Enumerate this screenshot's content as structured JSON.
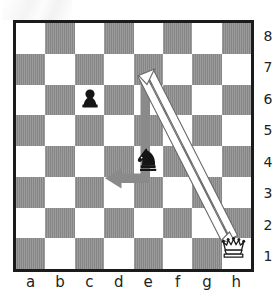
{
  "diagram": {
    "type": "chessboard",
    "orientation": "white-bottom",
    "board": {
      "files": [
        "a",
        "b",
        "c",
        "d",
        "e",
        "f",
        "g",
        "h"
      ],
      "ranks": [
        "8",
        "7",
        "6",
        "5",
        "4",
        "3",
        "2",
        "1"
      ],
      "light_square_color": "#ffffff",
      "dark_square_color": "#8c8c8c",
      "border_color": "#1b1b1b",
      "squares": 64
    },
    "pieces": [
      {
        "id": "black-pawn-c6",
        "piece": "pawn",
        "color": "black",
        "square": "c6",
        "file": "c",
        "rank": "6",
        "icon": "chess-pawn-icon"
      },
      {
        "id": "black-knight-e4",
        "piece": "knight",
        "color": "black",
        "square": "e4",
        "file": "e",
        "rank": "4",
        "icon": "chess-knight-icon"
      },
      {
        "id": "white-queen-h1",
        "piece": "queen",
        "color": "white",
        "square": "h1",
        "file": "h",
        "rank": "1",
        "icon": "chess-queen-icon"
      }
    ],
    "arrows": [
      {
        "id": "knight-move-arrow",
        "style": "solid-gray-elbow",
        "color": "#8a8a8a",
        "from": "e4",
        "to": "d2",
        "path": "e4-e2-d2",
        "description": "Knight move from e4 down the e-file to e2 then left to d2"
      },
      {
        "id": "queen-diagonal-arrow",
        "style": "white-double-line",
        "color": "#ffffff",
        "outline_color": "#5f5f5f",
        "from": "e4",
        "to": "h1",
        "path": "e4-h1",
        "description": "Diagonal line from the knight on e4 to the white queen on h1"
      }
    ]
  },
  "rank_labels": [
    "8",
    "7",
    "6",
    "5",
    "4",
    "3",
    "2",
    "1"
  ],
  "file_labels": [
    "a",
    "b",
    "c",
    "d",
    "e",
    "f",
    "g",
    "h"
  ]
}
